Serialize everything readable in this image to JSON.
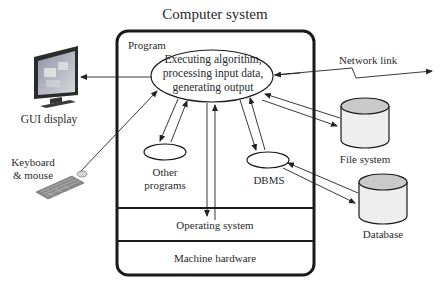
{
  "title": "Computer system",
  "program_label": "Program",
  "main_process": {
    "lines": [
      "Executing algorithm,",
      "processing input data,",
      "generating output"
    ]
  },
  "components": {
    "other_programs": [
      "Other",
      "programs"
    ],
    "dbms": "DBMS",
    "operating_system": "Operating system",
    "machine_hardware": "Machine hardware"
  },
  "external": {
    "gui_display": "GUI display",
    "keyboard_mouse": [
      "Keyboard",
      "& mouse"
    ],
    "network_link": "Network link",
    "file_system": "File system",
    "database": "Database"
  },
  "colors": {
    "line": "#222222",
    "cylinder_top": "#c8c8c8",
    "cylinder_body": "#efefef",
    "monitor_frame": "#2b2b2b",
    "monitor_screen": "#b9b9bf"
  }
}
